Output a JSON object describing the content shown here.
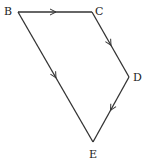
{
  "diagram": {
    "type": "directed-quadrilateral",
    "stroke_color": "#333333",
    "background": "#ffffff",
    "vertices": [
      {
        "id": "B",
        "label": "B",
        "x": 18,
        "y": 12,
        "lx": 4,
        "ly": 15
      },
      {
        "id": "C",
        "label": "C",
        "x": 92,
        "y": 12,
        "lx": 95,
        "ly": 15
      },
      {
        "id": "D",
        "label": "D",
        "x": 129,
        "y": 77,
        "lx": 133,
        "ly": 81
      },
      {
        "id": "E",
        "label": "E",
        "x": 93,
        "y": 142,
        "lx": 89,
        "ly": 158
      }
    ],
    "edges": [
      {
        "from": "B",
        "to": "C",
        "arrow": true
      },
      {
        "from": "C",
        "to": "D",
        "arrow": true
      },
      {
        "from": "D",
        "to": "E",
        "arrow": true
      },
      {
        "from": "B",
        "to": "E",
        "arrow": true
      }
    ]
  }
}
